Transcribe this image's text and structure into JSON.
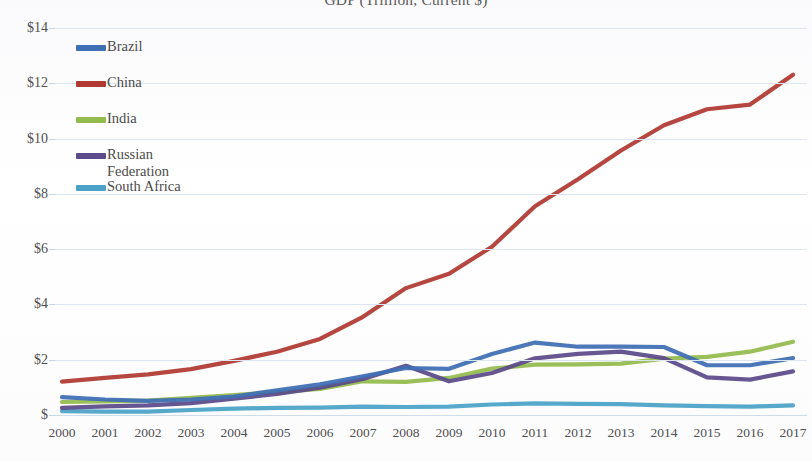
{
  "chart_data": {
    "type": "line",
    "title": "GDP (Trillion, Current $)",
    "xlabel": "",
    "ylabel": "",
    "x": [
      2000,
      2001,
      2002,
      2003,
      2004,
      2005,
      2006,
      2007,
      2008,
      2009,
      2010,
      2011,
      2012,
      2013,
      2014,
      2015,
      2016,
      2017
    ],
    "xlim": [
      2000,
      2017
    ],
    "ylim": [
      0,
      14
    ],
    "ytick_values": [
      0,
      2,
      4,
      6,
      8,
      10,
      12,
      14
    ],
    "ytick_labels": [
      "$",
      "$2",
      "$4",
      "$6",
      "$8",
      "$10",
      "$12",
      "$14"
    ],
    "xtick_labels": [
      "2000",
      "2001",
      "2002",
      "2003",
      "2004",
      "2005",
      "2006",
      "2007",
      "2008",
      "2009",
      "2010",
      "2011",
      "2012",
      "2013",
      "2014",
      "2015",
      "2016",
      "2017"
    ],
    "grid": true,
    "grid_axis": "y",
    "legend_position": "upper-left-inside",
    "series": [
      {
        "name": "Brazil",
        "color": "#3f6fb5",
        "values": [
          0.65,
          0.56,
          0.51,
          0.56,
          0.67,
          0.89,
          1.11,
          1.4,
          1.7,
          1.67,
          2.21,
          2.62,
          2.47,
          2.47,
          2.46,
          1.8,
          1.8,
          2.06
        ]
      },
      {
        "name": "China",
        "color": "#b03a32"
      },
      {
        "name": "India",
        "color": "#94bb4d"
      },
      {
        "name": "Russian Federation",
        "color": "#5b4b8a"
      },
      {
        "name": "South Africa",
        "color": "#4aa3c7"
      }
    ],
    "series_values": {
      "Brazil": [
        0.65,
        0.56,
        0.51,
        0.56,
        0.67,
        0.89,
        1.11,
        1.4,
        1.7,
        1.67,
        2.21,
        2.62,
        2.47,
        2.47,
        2.46,
        1.8,
        1.8,
        2.06
      ],
      "China": [
        1.21,
        1.34,
        1.47,
        1.66,
        1.96,
        2.29,
        2.75,
        3.55,
        4.59,
        5.11,
        6.09,
        7.55,
        8.53,
        9.57,
        10.48,
        11.06,
        11.23,
        12.31
      ],
      "India": [
        0.47,
        0.49,
        0.52,
        0.62,
        0.72,
        0.83,
        0.94,
        1.22,
        1.2,
        1.34,
        1.68,
        1.82,
        1.83,
        1.86,
        2.04,
        2.1,
        2.29,
        2.65
      ],
      "Russian Federation": [
        0.26,
        0.31,
        0.35,
        0.43,
        0.59,
        0.76,
        0.99,
        1.3,
        1.78,
        1.22,
        1.52,
        2.05,
        2.21,
        2.29,
        2.06,
        1.36,
        1.28,
        1.58
      ],
      "South Africa": [
        0.14,
        0.12,
        0.12,
        0.18,
        0.23,
        0.26,
        0.27,
        0.3,
        0.29,
        0.3,
        0.38,
        0.42,
        0.4,
        0.39,
        0.35,
        0.32,
        0.3,
        0.35
      ]
    }
  },
  "legend": {
    "items": [
      {
        "label": "Brazil",
        "color": "#3f6fb5"
      },
      {
        "label": "China",
        "color": "#b03a32"
      },
      {
        "label": "India",
        "color": "#94bb4d"
      },
      {
        "label": "Russian\nFederation",
        "color": "#5b4b8a"
      },
      {
        "label": "South Africa",
        "color": "#4aa3c7"
      }
    ]
  },
  "colors": {
    "gridline": "#dbe6f0",
    "axis_text": "#4f4f4f",
    "title_text": "#5b5b5b",
    "background": "#ffffff"
  }
}
